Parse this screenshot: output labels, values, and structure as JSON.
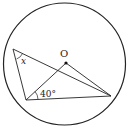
{
  "diagram": {
    "type": "circle-geometry",
    "circle": {
      "cx": 64.5,
      "cy": 64,
      "r": 61
    },
    "points": {
      "O": {
        "x": 66,
        "y": 63
      },
      "A": {
        "x": 13,
        "y": 49
      },
      "B": {
        "x": 26,
        "y": 100
      },
      "C": {
        "x": 111,
        "y": 96
      }
    },
    "segments": [
      [
        "A",
        "B"
      ],
      [
        "A",
        "C"
      ],
      [
        "B",
        "O"
      ],
      [
        "O",
        "C"
      ],
      [
        "B",
        "C"
      ]
    ],
    "labels": {
      "center": "O",
      "angle_x": "x",
      "angle_40": "40°"
    },
    "colors": {
      "stroke": "#222222",
      "background": "#ffffff"
    }
  }
}
